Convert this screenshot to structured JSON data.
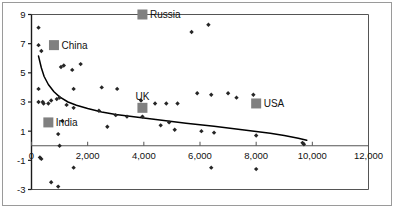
{
  "chart_data": {
    "type": "scatter",
    "title": "",
    "xlabel": "",
    "ylabel": "",
    "xlim": [
      0,
      12000
    ],
    "ylim": [
      -3,
      9
    ],
    "xticks": [
      0,
      2000,
      4000,
      6000,
      8000,
      10000,
      12000
    ],
    "xticklabels": [
      "0",
      "2,000",
      "4,000",
      "6,000",
      "8,000",
      "10,000",
      "12,000"
    ],
    "yticks": [
      -3,
      -1,
      1,
      3,
      5,
      7,
      9
    ],
    "yticklabels": [
      "-3",
      "-1",
      "1",
      "3",
      "5",
      "7",
      "9"
    ],
    "grid": false,
    "legend_position": "none",
    "marker_color": "#262626",
    "highlight_color": "#808080",
    "trend_color": "#000000",
    "series": [
      {
        "name": "countries",
        "marker": "diamond",
        "points": [
          [
            250,
            8.1
          ],
          [
            250,
            6.9
          ],
          [
            350,
            6.5
          ],
          [
            250,
            3.9
          ],
          [
            250,
            3.0
          ],
          [
            400,
            3.0
          ],
          [
            430,
            2.9
          ],
          [
            600,
            2.9
          ],
          [
            700,
            3.1
          ],
          [
            900,
            3.2
          ],
          [
            1000,
            3.3
          ],
          [
            1050,
            5.4
          ],
          [
            1150,
            5.5
          ],
          [
            1450,
            5.2
          ],
          [
            1750,
            5.6
          ],
          [
            1500,
            3.9
          ],
          [
            1250,
            2.8
          ],
          [
            1500,
            2.6
          ],
          [
            1100,
            1.7
          ],
          [
            950,
            0.8
          ],
          [
            1000,
            0.0
          ],
          [
            300,
            -0.8
          ],
          [
            350,
            -0.9
          ],
          [
            1500,
            -1.5
          ],
          [
            700,
            -2.5
          ],
          [
            950,
            -2.8
          ],
          [
            2400,
            2.4
          ],
          [
            2700,
            1.3
          ],
          [
            2500,
            4.0
          ],
          [
            3050,
            3.9
          ],
          [
            3000,
            2.1
          ],
          [
            3400,
            2.0
          ],
          [
            3950,
            9.0
          ],
          [
            3900,
            3.1
          ],
          [
            3950,
            2.0
          ],
          [
            4400,
            2.9
          ],
          [
            4800,
            2.9
          ],
          [
            4600,
            1.4
          ],
          [
            4900,
            1.6
          ],
          [
            5200,
            2.9
          ],
          [
            5100,
            1.1
          ],
          [
            5700,
            7.8
          ],
          [
            6300,
            8.3
          ],
          [
            5900,
            3.6
          ],
          [
            6400,
            3.5
          ],
          [
            6050,
            1.0
          ],
          [
            6500,
            0.9
          ],
          [
            6400,
            -1.5
          ],
          [
            7000,
            3.6
          ],
          [
            7300,
            3.3
          ],
          [
            7900,
            3.5
          ],
          [
            8000,
            0.7
          ],
          [
            8000,
            -1.6
          ],
          [
            9650,
            0.2
          ],
          [
            9700,
            0.1
          ]
        ]
      }
    ],
    "highlights": [
      {
        "name": "Russia",
        "x": 3950,
        "y": 9.0,
        "label_side": "right"
      },
      {
        "name": "China",
        "x": 800,
        "y": 6.9,
        "label_side": "right"
      },
      {
        "name": "UK",
        "x": 3950,
        "y": 2.6,
        "label_side": "above"
      },
      {
        "name": "USA",
        "x": 8000,
        "y": 2.9,
        "label_side": "right"
      },
      {
        "name": "India",
        "x": 600,
        "y": 1.6,
        "label_side": "right"
      }
    ],
    "trend": {
      "name": "power-fit",
      "points": [
        [
          250,
          6.15
        ],
        [
          350,
          5.35
        ],
        [
          450,
          4.75
        ],
        [
          600,
          4.2
        ],
        [
          800,
          3.7
        ],
        [
          1000,
          3.35
        ],
        [
          1300,
          3.0
        ],
        [
          1600,
          2.78
        ],
        [
          2000,
          2.55
        ],
        [
          2500,
          2.32
        ],
        [
          3000,
          2.15
        ],
        [
          3500,
          2.02
        ],
        [
          4000,
          1.9
        ],
        [
          4500,
          1.78
        ],
        [
          5000,
          1.66
        ],
        [
          5500,
          1.55
        ],
        [
          6000,
          1.44
        ],
        [
          6500,
          1.33
        ],
        [
          7000,
          1.22
        ],
        [
          7500,
          1.1
        ],
        [
          8000,
          0.98
        ],
        [
          8500,
          0.85
        ],
        [
          9000,
          0.7
        ],
        [
          9500,
          0.52
        ],
        [
          9800,
          0.38
        ]
      ]
    }
  }
}
